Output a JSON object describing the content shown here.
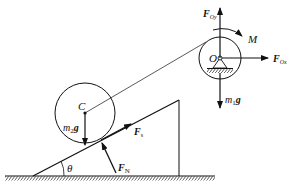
{
  "diagram": {
    "type": "free-body diagram",
    "colors": {
      "stroke": "#111111",
      "background": "#ffffff"
    },
    "labels": {
      "center_C": "C",
      "center_O": "O",
      "moment": "M",
      "angle": "θ",
      "weight_disk": {
        "main": "m",
        "sub": "2",
        "tail": "g"
      },
      "weight_pulley": {
        "main": "m",
        "sub": "1",
        "tail": "g"
      },
      "force_Oy": {
        "main": "F",
        "sub": "Oy"
      },
      "force_Ox": {
        "main": "F",
        "sub": "Ox"
      },
      "force_s": {
        "main": "F",
        "sub": "s"
      },
      "force_N": {
        "main": "F",
        "sub": "N"
      }
    }
  }
}
